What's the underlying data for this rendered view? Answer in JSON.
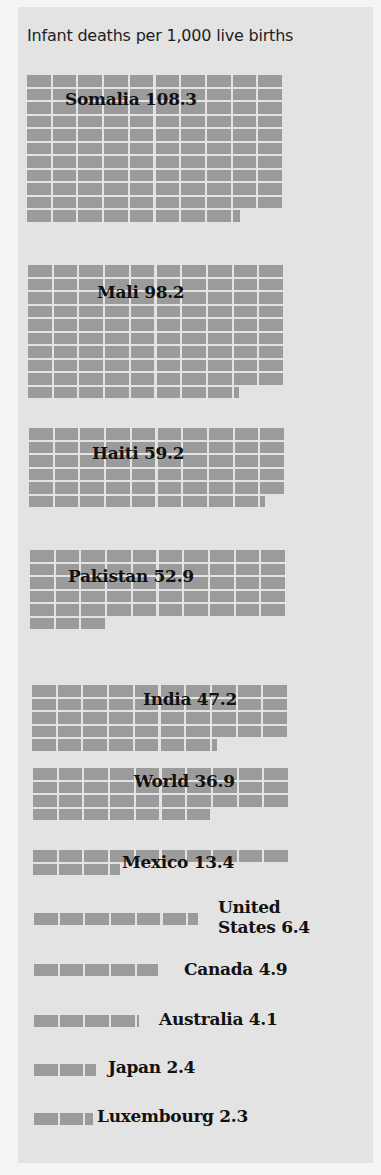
{
  "chart_data": {
    "type": "table",
    "subtype": "unit-grid (each cell = 1 infant death per 1,000 live births, 10 cells per row)",
    "title": "Infant deaths per 1,000 live births",
    "xlabel": "",
    "ylabel": "",
    "grid": false,
    "legend": null,
    "categories": [
      "Somalia",
      "Mali",
      "Haiti",
      "Pakistan",
      "India",
      "World",
      "Mexico",
      "United States",
      "Canada",
      "Australia",
      "Japan",
      "Luxembourg"
    ],
    "values": [
      108.3,
      98.2,
      59.2,
      52.9,
      47.2,
      36.9,
      13.4,
      6.4,
      4.9,
      4.1,
      2.4,
      2.3
    ],
    "units_per_row": 10
  },
  "title": "Infant deaths per 1,000 live births",
  "colors": {
    "panel": "#e3e3e3",
    "cell": "#9b9b9b",
    "text": "#111111"
  },
  "blocks": [
    {
      "country": "Somalia",
      "label": "Somalia 108.3",
      "value": 108.3,
      "x": 27,
      "y": 75,
      "lx": 65,
      "ly": 90
    },
    {
      "country": "Mali",
      "label": "Mali 98.2",
      "value": 98.2,
      "x": 28,
      "y": 265,
      "lx": 97,
      "ly": 283
    },
    {
      "country": "Haiti",
      "label": "Haiti 59.2",
      "value": 59.2,
      "x": 29,
      "y": 428,
      "lx": 92,
      "ly": 444
    },
    {
      "country": "Pakistan",
      "label": "Pakistan 52.9",
      "value": 52.9,
      "x": 30,
      "y": 550,
      "lx": 68,
      "ly": 567
    },
    {
      "country": "India",
      "label": "India 47.2",
      "value": 47.2,
      "x": 32,
      "y": 685,
      "lx": 143,
      "ly": 690
    },
    {
      "country": "World",
      "label": "World 36.9",
      "value": 36.9,
      "x": 33,
      "y": 768,
      "lx": 134,
      "ly": 772
    },
    {
      "country": "Mexico",
      "label": "Mexico 13.4",
      "value": 13.4,
      "x": 33,
      "y": 850,
      "lx": 122,
      "ly": 853
    },
    {
      "country": "United States",
      "label": "United\nStates 6.4",
      "label_line1": "United",
      "label_line2": "States 6.4",
      "value": 6.4,
      "x": 34,
      "y": 913,
      "lx": 218,
      "ly": 898
    },
    {
      "country": "Canada",
      "label": "Canada 4.9",
      "value": 4.9,
      "x": 34,
      "y": 964,
      "lx": 184,
      "ly": 960
    },
    {
      "country": "Australia",
      "label": "Australia 4.1",
      "value": 4.1,
      "x": 34,
      "y": 1015,
      "lx": 159,
      "ly": 1010
    },
    {
      "country": "Japan",
      "label": "Japan 2.4",
      "value": 2.4,
      "x": 34,
      "y": 1064,
      "lx": 108,
      "ly": 1058
    },
    {
      "country": "Luxembourg",
      "label": "Luxembourg 2.3",
      "value": 2.3,
      "x": 34,
      "y": 1113,
      "lx": 97,
      "ly": 1107
    }
  ]
}
